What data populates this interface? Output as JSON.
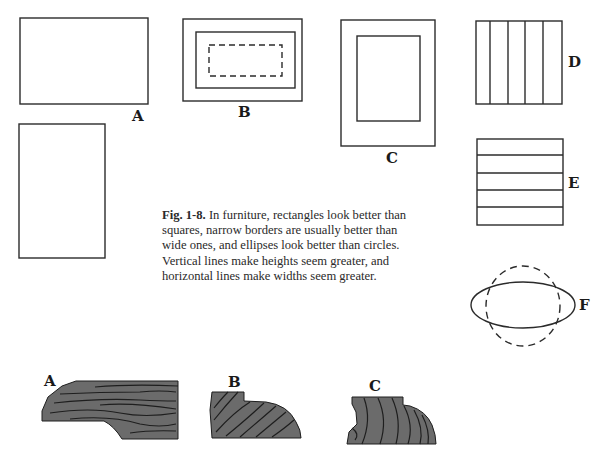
{
  "figure": {
    "number": "Fig. 1-8.",
    "caption": "In furniture, rectangles look better than squares, narrow borders are usually better than wide ones, and ellipses look better than circles. Vertical lines make heights seem greater, and horizontal lines make widths seem greater.",
    "caption_lines": [
      "In furniture, rectangles look better than",
      "squares, narrow borders are usually better than",
      "wide ones, and ellipses look better than circles.",
      "Vertical lines make heights seem greater, and",
      "horizontal lines make widths seem greater."
    ],
    "panels": {
      "A": {
        "label": "A",
        "description": "Horizontal rectangle and vertical rectangle"
      },
      "B": {
        "label": "B",
        "description": "Rectangle with narrow border and dashed inner rectangle"
      },
      "C": {
        "label": "C",
        "description": "Rectangle with wide border"
      },
      "D": {
        "label": "D",
        "description": "Square divided by vertical lines"
      },
      "E": {
        "label": "E",
        "description": "Square divided by horizontal lines"
      },
      "F": {
        "label": "F",
        "description": "Solid ellipse overlaid on dashed circle"
      }
    }
  },
  "moldings": {
    "A": {
      "label": "A",
      "description": "Wood profile with horizontal grain"
    },
    "B": {
      "label": "B",
      "description": "Wood profile with diagonal grain, rounded edge"
    },
    "C": {
      "label": "C",
      "description": "Wood profile with curved grain, rounded edge"
    },
    "fill_color": "#6b6b6b",
    "grain_color": "#1e1e1e"
  },
  "colors": {
    "ink": "#2b2b2b",
    "paper": "#ffffff"
  }
}
